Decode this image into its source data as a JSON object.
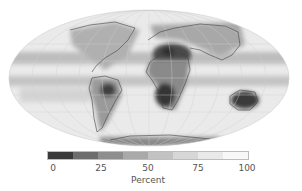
{
  "map": {
    "projection": "Mollweide",
    "shading": "grayscale, dark = low, light = high",
    "regions_low": [
      "Sahara / North Africa",
      "Southern Africa",
      "Central South America",
      "Australia",
      "Arabia"
    ],
    "regions_high": [
      "Southern Ocean band",
      "Northern Pacific / Atlantic",
      "Equatorial ITCZ band"
    ]
  },
  "colorbar": {
    "label": "Percent",
    "ticks": [
      "0",
      "25",
      "50",
      "75",
      "100"
    ],
    "tick_positions_px": [
      53,
      101,
      148,
      198,
      247
    ],
    "segments": [
      "#3a3a3a",
      "#6d6d6d",
      "#8e8e8e",
      "#a9a9a9",
      "#c2c2c2",
      "#d7d7d7",
      "#e9e9e9",
      "#f8f8f8"
    ]
  }
}
